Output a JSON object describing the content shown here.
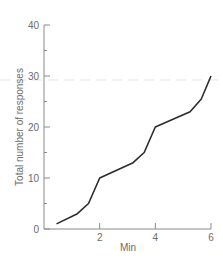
{
  "chart_data": {
    "type": "line",
    "title": "",
    "xlabel": "Min",
    "ylabel": "Total number of responses",
    "xlim": [
      0,
      6
    ],
    "ylim": [
      0,
      40
    ],
    "x_ticks": [
      2,
      4,
      6
    ],
    "x_tick_labels": [
      "2",
      "4",
      "6"
    ],
    "y_ticks": [
      0,
      10,
      20,
      30,
      40
    ],
    "y_tick_labels": [
      "0",
      "10",
      "20",
      "30",
      "40"
    ],
    "y_minor_ticks": [
      5,
      15,
      25,
      35
    ],
    "grid": false,
    "legend": null,
    "series": [
      {
        "name": "Cumulative responses",
        "x": [
          0.45,
          1.2,
          1.6,
          2.0,
          3.2,
          3.6,
          4.0,
          5.25,
          5.65,
          6.0
        ],
        "y": [
          1,
          3,
          5,
          10,
          13,
          15,
          20,
          23,
          25.5,
          30
        ]
      }
    ]
  }
}
